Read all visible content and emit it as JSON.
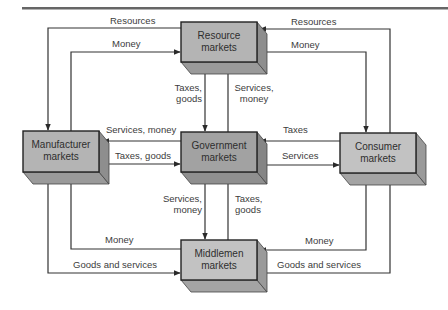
{
  "diagram": {
    "type": "flow",
    "colors": {
      "box_front": "#b4b4b4",
      "box_front_gov": "#a2a2a2",
      "box_side": "#8e8e8e",
      "box_bottom": "#9a9a9a",
      "line": "#333333",
      "rule": "#555555"
    },
    "nodes": {
      "resource": {
        "line1": "Resource",
        "line2": "markets"
      },
      "government": {
        "line1": "Government",
        "line2": "markets"
      },
      "manufacturer": {
        "line1": "Manufacturer",
        "line2": "markets"
      },
      "consumer": {
        "line1": "Consumer",
        "line2": "markets"
      },
      "middlemen": {
        "line1": "Middlemen",
        "line2": "markets"
      }
    },
    "edges": {
      "res_to_mfr": "Resources",
      "mfr_to_res": "Money",
      "con_to_res": "Resources",
      "res_to_con": "Money",
      "res_to_gov_1": "Taxes,",
      "res_to_gov_2": "goods",
      "gov_to_res_1": "Services,",
      "gov_to_res_2": "money",
      "gov_to_mfr": "Services, money",
      "mfr_to_gov": "Taxes, goods",
      "con_to_gov": "Taxes",
      "gov_to_con": "Services",
      "gov_to_mid_1": "Services,",
      "gov_to_mid_2": "money",
      "mid_to_gov_1": "Taxes,",
      "mid_to_gov_2": "goods",
      "mid_to_mfr": "Money",
      "mfr_to_mid": "Goods and services",
      "con_to_mid": "Money",
      "mid_to_con": "Goods and services"
    }
  }
}
